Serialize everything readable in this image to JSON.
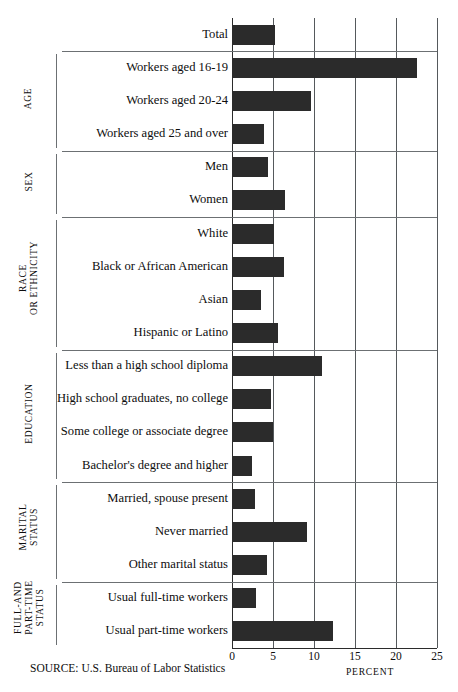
{
  "chart_data": {
    "type": "bar",
    "orientation": "horizontal",
    "title": "",
    "xlabel": "PERCENT",
    "ylabel": "",
    "xlim": [
      0,
      25
    ],
    "xticks": [
      0,
      5,
      10,
      15,
      20,
      25
    ],
    "grid": true,
    "legend": null,
    "source": "SOURCE: U.S. Bureau of Labor Statistics",
    "categories": [
      "Total",
      "Workers aged 16-19",
      "Workers aged 20-24",
      "Workers aged 25 and over",
      "Men",
      "Women",
      "White",
      "Black or African American",
      "Asian",
      "Hispanic or Latino",
      "Less than a high school diploma",
      "High school graduates, no college",
      "Some college or associate degree",
      "Bachelor's degree and higher",
      "Married, spouse present",
      "Never married",
      "Other marital status",
      "Usual full-time workers",
      "Usual part-time workers"
    ],
    "values": [
      5.3,
      22.6,
      9.6,
      3.9,
      4.4,
      6.5,
      5.1,
      6.3,
      3.5,
      5.6,
      11.0,
      4.8,
      5.0,
      2.4,
      2.8,
      9.2,
      4.3,
      2.9,
      12.3
    ],
    "groups": [
      {
        "name": "AGE",
        "lines": [
          "AGE"
        ],
        "start": 1,
        "end": 3
      },
      {
        "name": "SEX",
        "lines": [
          "SEX"
        ],
        "start": 4,
        "end": 5
      },
      {
        "name": "RACE OR ETHNICITY",
        "lines": [
          "RACE",
          "OR ETHNICITY"
        ],
        "start": 6,
        "end": 9
      },
      {
        "name": "EDUCATION",
        "lines": [
          "EDUCATION"
        ],
        "start": 10,
        "end": 13
      },
      {
        "name": "MARITAL STATUS",
        "lines": [
          "MARITAL",
          "STATUS"
        ],
        "start": 14,
        "end": 16
      },
      {
        "name": "FULL-AND PART-TIME STATUS",
        "lines": [
          "FULL-AND",
          "PART-TIME",
          "STATUS"
        ],
        "start": 17,
        "end": 18
      }
    ]
  }
}
